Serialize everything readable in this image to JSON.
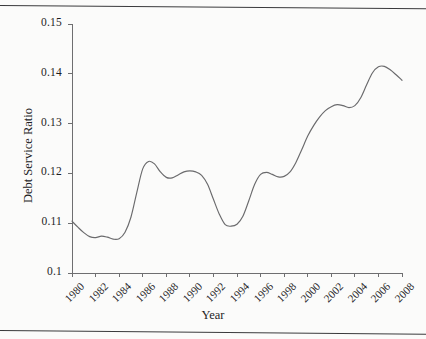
{
  "chart_data": {
    "type": "line",
    "title": "",
    "xlabel": "Year",
    "ylabel": "Debt Service Ratio",
    "xlim": [
      1980,
      2008
    ],
    "ylim": [
      0.1,
      0.15
    ],
    "grid": false,
    "legend": null,
    "line_color": "#6a6a6c",
    "ytick_labels": [
      "0.15",
      "0.14",
      "0.13",
      "0.12",
      "0.11",
      "0.1"
    ],
    "ytick_values": [
      0.15,
      0.14,
      0.13,
      0.12,
      0.11,
      0.1
    ],
    "xtick_labels": [
      "1980",
      "1982",
      "1984",
      "1986",
      "1988",
      "1990",
      "1992",
      "1994",
      "1996",
      "1998",
      "2000",
      "2002",
      "2004",
      "2006",
      "2008"
    ],
    "xtick_values": [
      1980,
      1982,
      1984,
      1986,
      1988,
      1990,
      1992,
      1994,
      1996,
      1998,
      2000,
      2002,
      2004,
      2006,
      2008
    ],
    "x": [
      1980,
      1980.5,
      1981,
      1981.5,
      1982,
      1982.5,
      1983,
      1983.5,
      1984,
      1984.5,
      1985,
      1985.5,
      1986,
      1986.5,
      1987,
      1987.5,
      1988,
      1988.5,
      1989,
      1989.5,
      1990,
      1990.5,
      1991,
      1991.5,
      1992,
      1992.5,
      1993,
      1993.5,
      1994,
      1994.5,
      1995,
      1995.5,
      1996,
      1996.5,
      1997,
      1997.5,
      1998,
      1998.5,
      1999,
      1999.5,
      2000,
      2000.5,
      2001,
      2001.5,
      2002,
      2002.5,
      2003,
      2003.5,
      2004,
      2004.5,
      2005,
      2005.5,
      2006,
      2006.5,
      2007,
      2007.5,
      2008
    ],
    "values": [
      0.1104,
      0.1092,
      0.1081,
      0.1073,
      0.1071,
      0.1074,
      0.1072,
      0.1068,
      0.1069,
      0.1082,
      0.1112,
      0.1162,
      0.1209,
      0.1224,
      0.1219,
      0.1203,
      0.1192,
      0.1191,
      0.1197,
      0.1203,
      0.1205,
      0.1203,
      0.1196,
      0.1178,
      0.1148,
      0.1118,
      0.1097,
      0.1094,
      0.1098,
      0.1114,
      0.1145,
      0.1178,
      0.1198,
      0.1202,
      0.1198,
      0.1193,
      0.1194,
      0.1203,
      0.1222,
      0.1248,
      0.1275,
      0.1296,
      0.1313,
      0.1326,
      0.1334,
      0.1338,
      0.1336,
      0.1332,
      0.1336,
      0.1352,
      0.1378,
      0.1402,
      0.1414,
      0.1415,
      0.1408,
      0.1398,
      0.1387
    ],
    "series": [
      {
        "name": "Debt Service Ratio",
        "annual_x": [
          1980,
          1981,
          1982,
          1983,
          1984,
          1985,
          1986,
          1987,
          1988,
          1989,
          1990,
          1991,
          1992,
          1993,
          1994,
          1995,
          1996,
          1997,
          1998,
          1999,
          2000,
          2001,
          2002,
          2003,
          2004,
          2005,
          2006,
          2007,
          2008
        ],
        "annual_values": [
          0.1104,
          0.1081,
          0.1071,
          0.1072,
          0.1069,
          0.1112,
          0.1209,
          0.1219,
          0.1192,
          0.1197,
          0.1205,
          0.1196,
          0.1148,
          0.1097,
          0.1098,
          0.1145,
          0.1198,
          0.1198,
          0.1194,
          0.1222,
          0.1275,
          0.1313,
          0.1334,
          0.1336,
          0.1336,
          0.1378,
          0.1414,
          0.1408,
          0.1387
        ]
      }
    ],
    "annotations": []
  }
}
